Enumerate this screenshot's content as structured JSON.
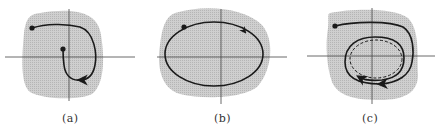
{
  "figure": {
    "colors": {
      "region_fill": "#c4c4c4",
      "axis": "#444444",
      "trajectory": "#1a1a1a",
      "background": "#ffffff"
    },
    "panels": [
      {
        "id": "a",
        "label": "(a)",
        "description": "Trajectory starting at a point spirals inward to a second point (stable equilibrium) inside the shaded region"
      },
      {
        "id": "b",
        "label": "(b)",
        "description": "Closed orbit (periodic trajectory) inside the shaded region"
      },
      {
        "id": "c",
        "label": "(c)",
        "description": "Trajectory approaches a limit cycle (dashed) inside the shaded region"
      }
    ]
  }
}
